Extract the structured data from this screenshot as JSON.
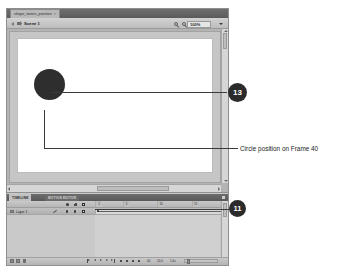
{
  "app": {
    "document_tab": {
      "title": "shape_tween_position",
      "close": "×"
    },
    "edit_bar": {
      "back_label": "back-arrow",
      "scene_label": "Scene 1",
      "tool_icons": [
        "edit-scene-icon",
        "edit-symbols-icon"
      ],
      "zoom_value": "100%"
    },
    "stage": {
      "shape_name": "circle",
      "shape_color": "#2e2e2e"
    },
    "timeline": {
      "tabs": [
        {
          "label": "TIMELINE",
          "active": true
        },
        {
          "label": "MOTION EDITOR",
          "active": false
        }
      ],
      "column_icons": [
        "eye-icon",
        "lock-icon",
        "outline-icon"
      ],
      "ruler_labels": [
        "1",
        "5",
        "10",
        "15",
        "20",
        "25",
        "30",
        "35",
        "40",
        "45"
      ],
      "layer": {
        "name": "Layer 1",
        "pencil": "pencil-icon",
        "eye": "●",
        "lock": "●",
        "outline": "□"
      },
      "keyframes": [
        1,
        20,
        40
      ],
      "playhead_frame": 40,
      "status": {
        "current_frame": "40",
        "fps": "24.0",
        "elapsed": "1.6s"
      },
      "layer_buttons": [
        "new-layer-icon",
        "new-folder-icon",
        "delete-layer-icon"
      ],
      "playback_buttons": [
        "first-frame-icon",
        "step-back-icon",
        "play-icon",
        "step-forward-icon",
        "last-frame-icon",
        "onion-skin-icon",
        "onion-outline-icon",
        "edit-multiple-icon",
        "modify-markers-icon"
      ]
    }
  },
  "annotations": {
    "callouts": [
      {
        "number": "13",
        "target": "circle-on-stage"
      },
      {
        "number": "11",
        "target": "timeline-keyframe"
      }
    ],
    "labels": [
      {
        "text": "Circle position on Frame 40"
      }
    ]
  },
  "colors": {
    "callout_fill": "#2b2b2b",
    "callout_text": "#ffffff",
    "leader_line": "#3a3a3a",
    "stage_white": "#ffffff",
    "panel_gray": "#c4c4c4"
  }
}
